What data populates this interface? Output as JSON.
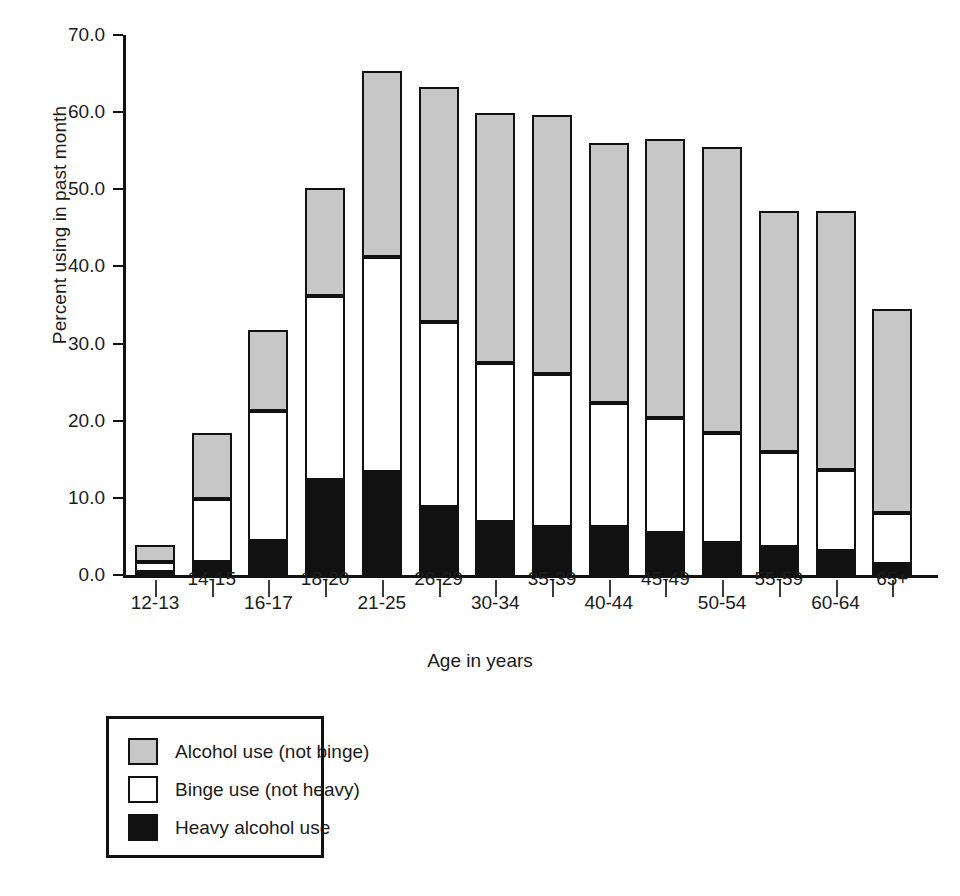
{
  "chart_data": {
    "type": "bar",
    "stacked": true,
    "title": "",
    "xlabel": "Age in years",
    "ylabel": "Percent using in past month",
    "ylim": [
      0.0,
      70.0
    ],
    "yticks": [
      "0.0",
      "10.0",
      "20.0",
      "30.0",
      "40.0",
      "50.0",
      "60.0",
      "70.0"
    ],
    "ytick_values": [
      0,
      10,
      20,
      30,
      40,
      50,
      60,
      70
    ],
    "grid": false,
    "legend_position": "below-left",
    "categories": [
      "12-13",
      "14-15",
      "16-17",
      "18-20",
      "21-25",
      "26-29",
      "30-34",
      "35-39",
      "40-44",
      "45-49",
      "50-54",
      "55-59",
      "60-64",
      "65+"
    ],
    "series": [
      {
        "name": "Heavy alcohol use",
        "color": "#111111",
        "values": [
          0.4,
          1.7,
          4.4,
          12.3,
          13.4,
          8.8,
          6.9,
          6.2,
          6.2,
          5.4,
          4.2,
          3.6,
          3.1,
          1.4
        ]
      },
      {
        "name": "Binge use (not heavy)",
        "color": "#ffffff",
        "values": [
          1.3,
          8.2,
          16.9,
          23.9,
          27.8,
          24.0,
          20.6,
          19.8,
          16.1,
          15.0,
          14.2,
          12.3,
          10.5,
          6.7
        ]
      },
      {
        "name": "Alcohol use (not binge)",
        "color": "#c7c7c7",
        "values": [
          2.2,
          8.5,
          10.5,
          14.0,
          24.2,
          30.5,
          32.4,
          33.6,
          33.7,
          36.1,
          37.1,
          31.3,
          33.6,
          26.4
        ]
      }
    ],
    "totals": [
      3.9,
      18.4,
      31.8,
      50.2,
      65.4,
      63.3,
      59.9,
      59.6,
      56.0,
      56.5,
      55.5,
      47.2,
      47.2,
      34.5
    ],
    "cumulative": {
      "heavy_top": [
        0.4,
        1.7,
        4.4,
        12.3,
        13.4,
        8.8,
        6.9,
        6.2,
        6.2,
        5.4,
        4.2,
        3.6,
        3.1,
        1.4
      ],
      "binge_top": [
        1.7,
        9.9,
        21.3,
        36.2,
        41.2,
        32.8,
        27.5,
        26.0,
        22.3,
        20.4,
        18.4,
        15.9,
        13.6,
        8.1
      ],
      "alcohol_top": [
        3.9,
        18.4,
        31.8,
        50.2,
        65.4,
        63.3,
        59.9,
        59.6,
        56.0,
        56.5,
        55.5,
        47.2,
        47.2,
        34.5
      ]
    },
    "legend": [
      {
        "label": "Alcohol use (not binge)",
        "swatch": "gray"
      },
      {
        "label": "Binge use (not heavy)",
        "swatch": "white"
      },
      {
        "label": "Heavy alcohol use",
        "swatch": "black"
      }
    ]
  }
}
